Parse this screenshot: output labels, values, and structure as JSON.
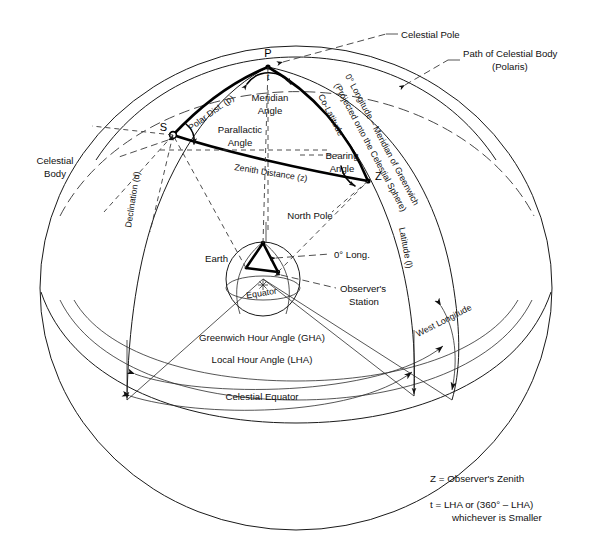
{
  "figure": {
    "type": "diagram"
  },
  "points": {
    "p": "P",
    "s": "S",
    "z": "Z",
    "t": "t"
  },
  "triangle_labels": {
    "polar_distance": "Polar Dist. (p)",
    "meridian_angle_line1": "Meridian",
    "meridian_angle_line2": "Angle",
    "parallactic_angle_line1": "Parallactic",
    "parallactic_angle_line2": "Angle",
    "co_latitude": "Co-Latitude",
    "bearing_angle_line1": "Bearing",
    "bearing_angle_line2": "Angle",
    "zenith_distance": "Zenith Distance (z)"
  },
  "callouts": {
    "celestial_pole": "Celestial Pole",
    "path_of_body_line1": "Path of Celestial Body",
    "path_of_body_line2": "(Polaris)",
    "celestial_body_line1": "Celestial",
    "celestial_body_line2": "Body",
    "zero_longitude_line1": "0° Longitude – Meridian of Greenwich",
    "zero_longitude_line2": "(Projected onto the Celestial Sphere)",
    "latitude": "Latitude (l)",
    "declination": "Declination (d)",
    "west_longitude": "West Longitude",
    "gha": "Greenwich Hour Angle (GHA)",
    "lha": "Local Hour Angle (LHA)",
    "celestial_equator": "Celestial Equator"
  },
  "earth_inset": {
    "north_pole": "North Pole",
    "earth": "Earth",
    "equator": "Equator",
    "zero_long": "0° Long.",
    "observers_station_line1": "Observer's",
    "observers_station_line2": "Station"
  },
  "legend": {
    "line1": "Z = Observer's Zenith",
    "line2": "t  = LHA or (360° – LHA)",
    "line3": "whichever is Smaller"
  },
  "colors": {
    "ink": "#000000",
    "line": "#1a1a1a",
    "dash": "#3a3a3a",
    "background": "#ffffff"
  }
}
